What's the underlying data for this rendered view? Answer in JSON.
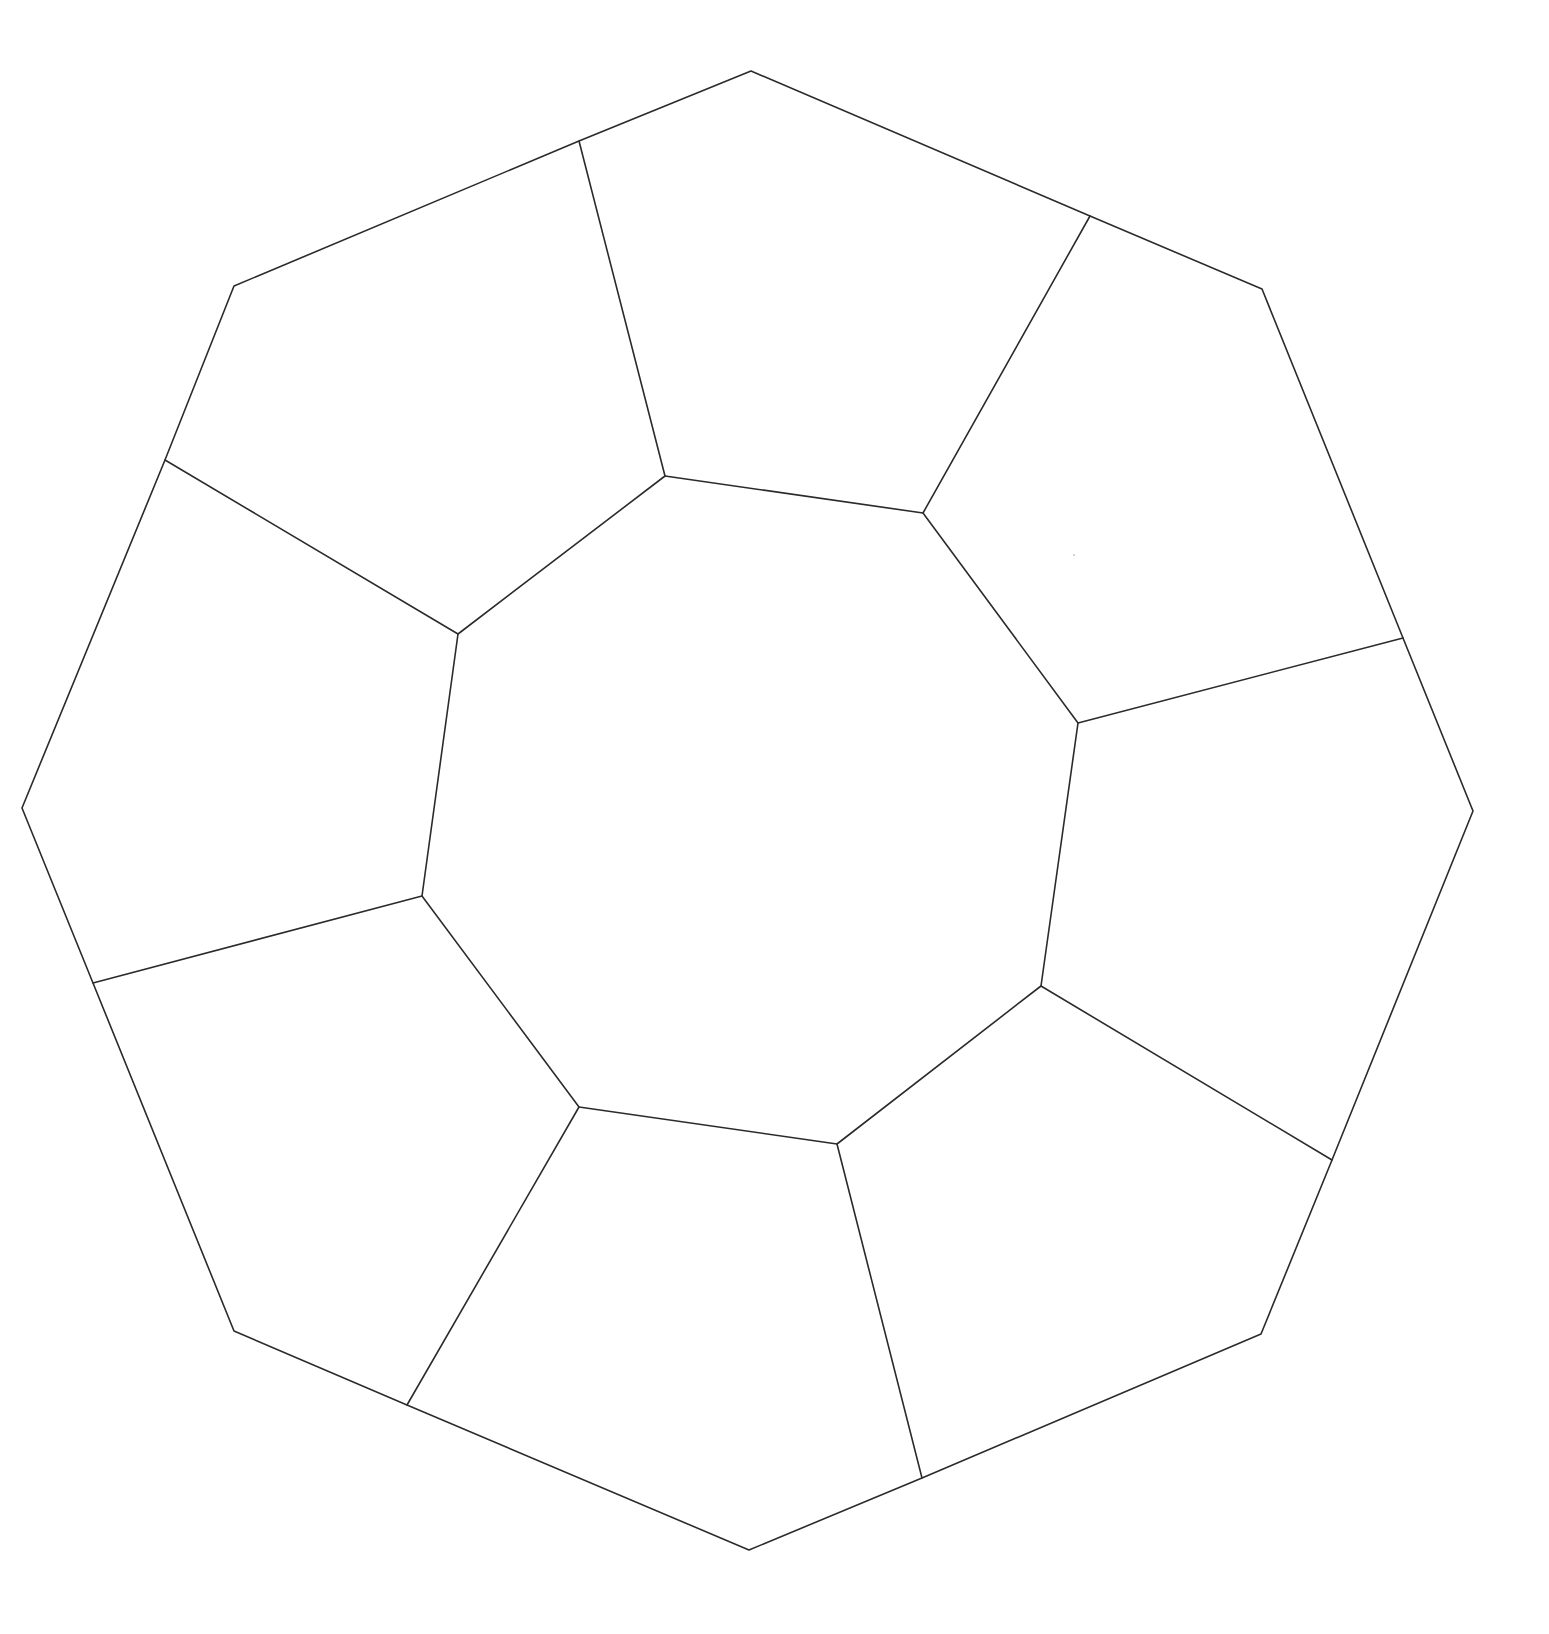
{
  "diagram": {
    "stroke_color": "#2b2b2b",
    "background": "#ffffff",
    "outer_boundary": [
      [
        751,
        71
      ],
      [
        1090,
        216
      ],
      [
        1262,
        289
      ],
      [
        1403,
        638
      ],
      [
        1473,
        811
      ],
      [
        1332,
        1160
      ],
      [
        1261,
        1334
      ],
      [
        922,
        1478
      ],
      [
        749,
        1550
      ],
      [
        407,
        1405
      ],
      [
        234,
        1331
      ],
      [
        93,
        983
      ],
      [
        22,
        808
      ],
      [
        165,
        460
      ],
      [
        234,
        286
      ],
      [
        579,
        141
      ]
    ],
    "inner_octagon": [
      [
        665,
        476
      ],
      [
        923,
        513
      ],
      [
        1078,
        723
      ],
      [
        1041,
        986
      ],
      [
        837,
        1144
      ],
      [
        579,
        1107
      ],
      [
        422,
        896
      ],
      [
        458,
        634
      ]
    ],
    "spokes": [
      [
        [
          579,
          141
        ],
        [
          665,
          476
        ]
      ],
      [
        [
          1090,
          216
        ],
        [
          923,
          513
        ]
      ],
      [
        [
          1403,
          638
        ],
        [
          1078,
          723
        ]
      ],
      [
        [
          1332,
          1160
        ],
        [
          1041,
          986
        ]
      ],
      [
        [
          922,
          1478
        ],
        [
          837,
          1144
        ]
      ],
      [
        [
          407,
          1405
        ],
        [
          579,
          1107
        ]
      ],
      [
        [
          93,
          983
        ],
        [
          422,
          896
        ]
      ],
      [
        [
          165,
          460
        ],
        [
          458,
          634
        ]
      ]
    ],
    "stray_mark": [
      1074,
      555
    ]
  }
}
